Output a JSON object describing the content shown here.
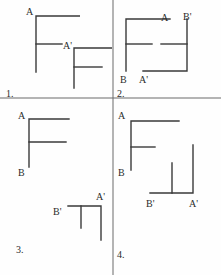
{
  "figure": {
    "width": 221,
    "height": 275,
    "background_color": "#fefefe",
    "stroke_color": "#3a3a3a",
    "text_color": "#2b2b2b",
    "divider_color": "#6b6b6b"
  },
  "panels": [
    {
      "number_label": "1.",
      "quadrant": "top-left",
      "labels": [
        {
          "text": "A",
          "x": 26,
          "y": 7
        },
        {
          "text": "A'",
          "x": 63,
          "y": 41
        }
      ]
    },
    {
      "number_label": "2.",
      "quadrant": "top-right",
      "labels": [
        {
          "text": "A",
          "x": 161,
          "y": 13
        },
        {
          "text": "B'",
          "x": 183,
          "y": 12
        },
        {
          "text": "B",
          "x": 120,
          "y": 75
        },
        {
          "text": "A'",
          "x": 139,
          "y": 75
        }
      ]
    },
    {
      "number_label": "3.",
      "quadrant": "bottom-left",
      "labels": [
        {
          "text": "A",
          "x": 18,
          "y": 111
        },
        {
          "text": "B",
          "x": 18,
          "y": 168
        },
        {
          "text": "B'",
          "x": 53,
          "y": 207
        },
        {
          "text": "A'",
          "x": 96,
          "y": 192
        }
      ]
    },
    {
      "number_label": "4.",
      "quadrant": "bottom-right",
      "labels": [
        {
          "text": "A",
          "x": 118,
          "y": 111
        },
        {
          "text": "B",
          "x": 118,
          "y": 168
        },
        {
          "text": "B'",
          "x": 146,
          "y": 199
        },
        {
          "text": "A'",
          "x": 189,
          "y": 199
        }
      ]
    }
  ],
  "quadrant_numbers": [
    {
      "text": "1.",
      "x": 6,
      "y": 89
    },
    {
      "text": "2.",
      "x": 117,
      "y": 89
    },
    {
      "text": "3.",
      "x": 16,
      "y": 245
    },
    {
      "text": "4.",
      "x": 117,
      "y": 250
    }
  ]
}
